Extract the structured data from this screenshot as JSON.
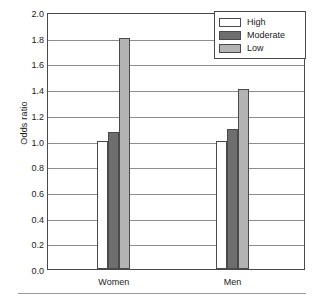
{
  "chart_data": {
    "type": "bar",
    "title": "",
    "xlabel": "",
    "ylabel": "Odds ratio",
    "categories": [
      "Women",
      "Men"
    ],
    "series": [
      {
        "name": "High",
        "values": [
          1.0,
          1.0
        ],
        "color": "#ffffff"
      },
      {
        "name": "Moderate",
        "values": [
          1.07,
          1.09
        ],
        "color": "#6e6e6e"
      },
      {
        "name": "Low",
        "values": [
          1.8,
          1.4
        ],
        "color": "#b3b3b3"
      }
    ],
    "ylim": [
      0.0,
      2.0
    ],
    "ytick_step": 0.2,
    "yticks": [
      "2.0",
      "1.8",
      "1.6",
      "1.4",
      "1.2",
      "1.0",
      "0.8",
      "0.6",
      "0.4",
      "0.2",
      "0.0"
    ],
    "grid": true,
    "legend_position": "top-right"
  },
  "legend": {
    "entries": [
      {
        "label": "High"
      },
      {
        "label": "Moderate"
      },
      {
        "label": "Low"
      }
    ]
  }
}
